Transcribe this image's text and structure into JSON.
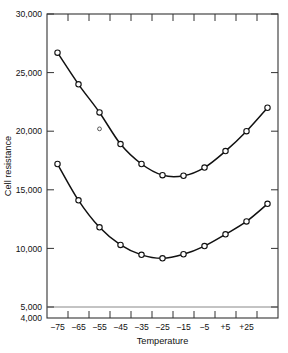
{
  "chart_data": {
    "type": "line",
    "title": "",
    "xlabel": "Temperature",
    "ylabel": "Cell resistance",
    "grid": false,
    "legend": "none",
    "x_tick_labels": [
      "−75",
      "−65",
      "−55",
      "−45",
      "−35",
      "−25",
      "−15",
      "−5",
      "+5",
      "+25"
    ],
    "x_values": [
      -75,
      -65,
      -55,
      -45,
      -35,
      -25,
      -15,
      -5,
      5,
      25
    ],
    "y_tick_labels": [
      "30,000",
      "25,000",
      "20,000",
      "15,000",
      "10,000",
      "5,000",
      "4,000"
    ],
    "y_tick_values": [
      30000,
      25000,
      20000,
      15000,
      10000,
      5000,
      4000
    ],
    "ylim": [
      4000,
      30000
    ],
    "axis_break_note": "compressed segment between 4,000 and 5,000",
    "series": [
      {
        "name": "upper-curve",
        "x": [
          -75,
          -65,
          -55,
          -45,
          -35,
          -25,
          -15,
          -5,
          5,
          15,
          25
        ],
        "values": [
          26700,
          24000,
          21600,
          18900,
          17200,
          16250,
          16200,
          16900,
          18300,
          20000,
          22000
        ]
      },
      {
        "name": "lower-curve",
        "x": [
          -75,
          -65,
          -55,
          -45,
          -35,
          -25,
          -15,
          -5,
          5,
          15,
          25
        ],
        "values": [
          17200,
          14100,
          11800,
          10300,
          9450,
          9150,
          9500,
          10200,
          11200,
          12300,
          13800
        ]
      }
    ],
    "annotations": [
      {
        "name": "outlier-point",
        "x": -55,
        "y": 20200,
        "marker": "open-circle-small"
      }
    ]
  }
}
